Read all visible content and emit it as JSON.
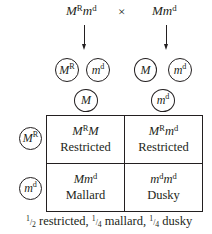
{
  "cross": {
    "parent1": {
      "base": "M",
      "sup1": "R",
      "base2": "m",
      "sup2": "d"
    },
    "operator": "×",
    "parent2": {
      "base": "Mm",
      "sup": "d"
    }
  },
  "gametes": {
    "parent1": [
      {
        "base": "M",
        "sup": "R"
      },
      {
        "base": "m",
        "sup": "d"
      }
    ],
    "parent2": [
      {
        "base": "M",
        "sup": ""
      },
      {
        "base": "m",
        "sup": "d"
      }
    ]
  },
  "punnett": {
    "column_headers": [
      {
        "base": "M",
        "sup": ""
      },
      {
        "base": "m",
        "sup": "d"
      }
    ],
    "row_headers": [
      {
        "base": "M",
        "sup": "R"
      },
      {
        "base": "m",
        "sup": "d"
      }
    ],
    "cells": [
      [
        {
          "genotype": {
            "a": "M",
            "a_sup": "R",
            "b": "M",
            "b_sup": ""
          },
          "phenotype": "Restricted"
        },
        {
          "genotype": {
            "a": "M",
            "a_sup": "R",
            "b": "m",
            "b_sup": "d"
          },
          "phenotype": "Restricted"
        }
      ],
      [
        {
          "genotype": {
            "a": "Mm",
            "a_sup": "",
            "b": "",
            "b_sup": "d"
          },
          "phenotype": "Mallard"
        },
        {
          "genotype": {
            "a": "m",
            "a_sup": "d",
            "b": "m",
            "b_sup": "d"
          },
          "phenotype": "Dusky"
        }
      ]
    ]
  },
  "summary": {
    "items": [
      {
        "num": "1",
        "den": "2",
        "label": " restricted,"
      },
      {
        "num": "1",
        "den": "4",
        "label": " mallard,"
      },
      {
        "num": "1",
        "den": "4",
        "label": " dusky"
      }
    ]
  }
}
